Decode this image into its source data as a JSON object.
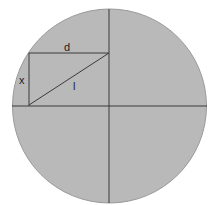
{
  "diagram": {
    "labels": {
      "d": "d",
      "x": "x",
      "l": "l"
    },
    "colors": {
      "background": "#ffffff",
      "circle_fill": "#b9b9b9",
      "circle_stroke": "#9a9a9a",
      "line": "#3a3a3a"
    }
  }
}
